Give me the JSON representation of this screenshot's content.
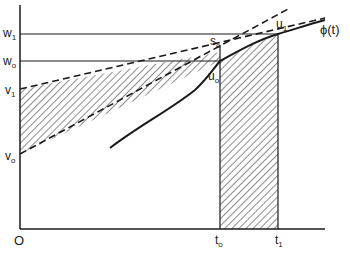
{
  "diagram": {
    "origin_label": "O",
    "y_axis_labels": [
      {
        "id": "w1",
        "main": "w",
        "sub": "1"
      },
      {
        "id": "w0",
        "main": "w",
        "sub": "o"
      },
      {
        "id": "v1",
        "main": "v",
        "sub": "1"
      },
      {
        "id": "v0",
        "main": "v",
        "sub": "o"
      }
    ],
    "x_axis_labels": [
      {
        "id": "t0",
        "main": "t",
        "sub": "o"
      },
      {
        "id": "t1",
        "main": "t",
        "sub": "1"
      }
    ],
    "point_labels": [
      {
        "id": "s0",
        "main": "s",
        "sub": "o"
      },
      {
        "id": "u0",
        "main": "u",
        "sub": "o"
      },
      {
        "id": "u1",
        "main": "u",
        "sub": "1"
      }
    ],
    "curve_label": "ϕ(t)",
    "colors": {
      "line": "#1a1a1a",
      "background": "#ffffff"
    }
  }
}
